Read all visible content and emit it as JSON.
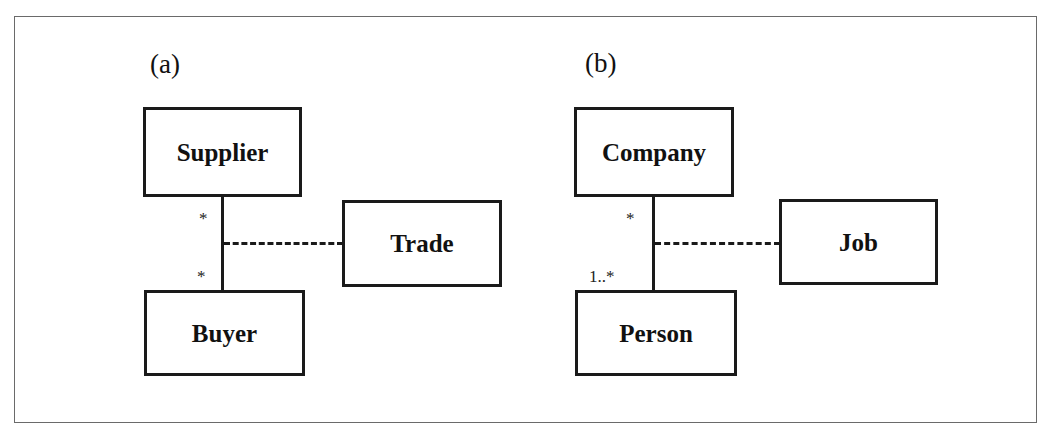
{
  "diagram": {
    "type": "UML class diagram - association classes",
    "panels": [
      {
        "label": "(a)",
        "classes": {
          "top": "Supplier",
          "bottom": "Buyer",
          "association_class": "Trade"
        },
        "association": {
          "top_multiplicity": "*",
          "bottom_multiplicity": "*",
          "association_class_link": "dashed"
        }
      },
      {
        "label": "(b)",
        "classes": {
          "top": "Company",
          "bottom": "Person",
          "association_class": "Job"
        },
        "association": {
          "top_multiplicity": "*",
          "bottom_multiplicity": "1..*",
          "association_class_link": "dashed"
        }
      }
    ],
    "colors": {
      "line": "#1a1a1a",
      "frame": "#6a6a6a",
      "background": "#ffffff"
    }
  }
}
